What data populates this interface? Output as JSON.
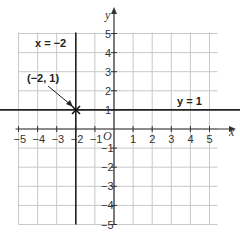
{
  "diagram": {
    "type": "coordinate-grid",
    "x_range": [
      -5,
      5
    ],
    "y_range": [
      -5,
      5
    ],
    "axis_labels": {
      "x": "x",
      "y": "y",
      "origin": "O"
    },
    "x_ticks": [
      "−5",
      "−4",
      "−3",
      "−2",
      "−1",
      "1",
      "2",
      "3",
      "4",
      "5"
    ],
    "y_ticks": [
      "5",
      "4",
      "3",
      "2",
      "1",
      "−1",
      "−2",
      "−3",
      "−4",
      "−5"
    ],
    "lines": [
      {
        "equation": "x = −2",
        "kind": "vertical",
        "value": -2
      },
      {
        "equation": "y = 1",
        "kind": "horizontal",
        "value": 1
      }
    ],
    "point": {
      "label": "(−2, 1)",
      "x": -2,
      "y": 1,
      "marker": "cross"
    },
    "colors": {
      "grid": "#c8c8c8",
      "axis": "#333333",
      "line": "#222222"
    }
  }
}
